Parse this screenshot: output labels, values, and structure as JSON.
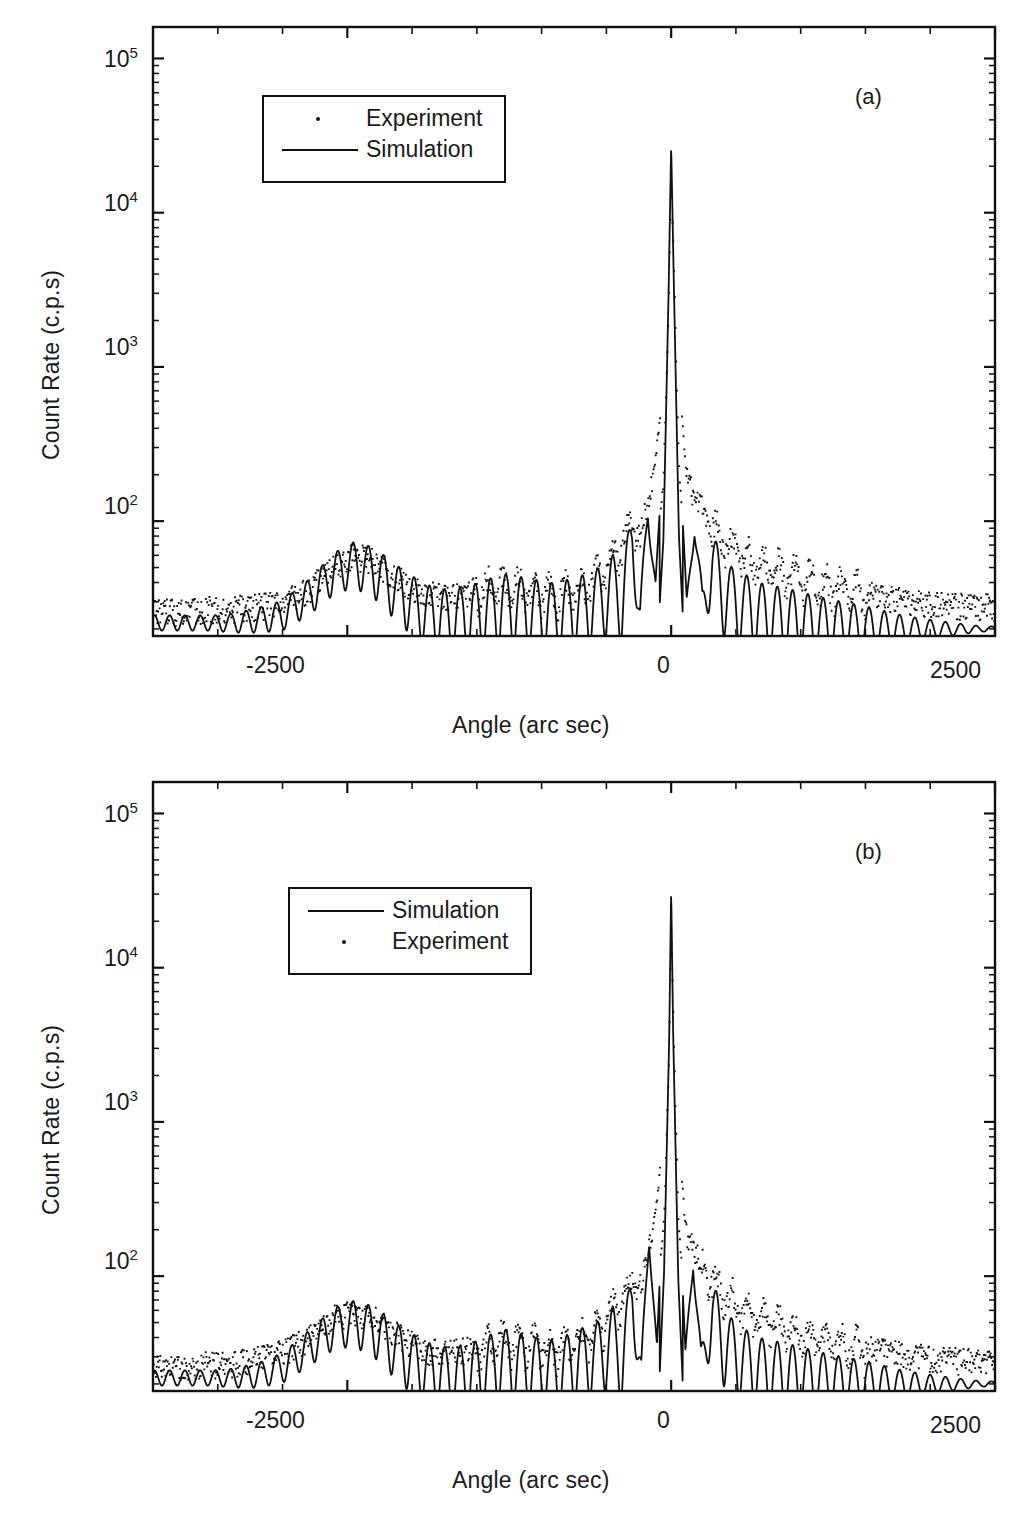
{
  "figure": {
    "type": "x-ray-rocking-curve-figure",
    "background_color": "#ffffff",
    "line_color": "#111111"
  },
  "panels": [
    {
      "tag": "(a)",
      "xlabel": "Angle (arc sec)",
      "ylabel": "Count Rate (c.p.s)",
      "xticks": [
        "-2500",
        "0",
        "2500"
      ],
      "yticks": [
        "10",
        "10",
        "10",
        "10"
      ],
      "yexp": [
        "5",
        "4",
        "3",
        "2"
      ],
      "legend": [
        {
          "label": "Experiment",
          "marker": "dot"
        },
        {
          "label": "Simulation",
          "marker": "line"
        }
      ]
    },
    {
      "tag": "(b)",
      "xlabel": "Angle (arc sec)",
      "ylabel": "Count Rate (c.p.s)",
      "xticks": [
        "-2500",
        "0",
        "2500"
      ],
      "yticks": [
        "10",
        "10",
        "10",
        "10"
      ],
      "yexp": [
        "5",
        "4",
        "3",
        "2"
      ],
      "legend": [
        {
          "label": "Simulation",
          "marker": "line"
        },
        {
          "label": "Experiment",
          "marker": "dot"
        }
      ]
    }
  ],
  "chart_data": [
    {
      "type": "line",
      "title": "(a)",
      "xlabel": "Angle (arc sec)",
      "ylabel": "Count Rate (c.p.s)",
      "xlim": [
        -4000,
        2500
      ],
      "ylim": [
        18,
        160000
      ],
      "yscale": "log",
      "xticks": [
        -2500,
        0,
        2500
      ],
      "yticks": [
        100,
        1000,
        10000,
        100000
      ],
      "ytick_labels": [
        "10^2",
        "10^3",
        "10^4",
        "10^5"
      ],
      "grid": false,
      "legend_position": "upper-left-inside",
      "series": [
        {
          "name": "Experiment",
          "style": "dotted-points",
          "description": "Measured rocking curve: noisy baseline ~25 c.p.s at far left, broad layer satellite peak centred near -2450 arc sec reaching ~60 c.p.s, weaker interference fringes between -2000 and -400, rising shoulder of Pendellosung fringes to ~300 c.p.s near -150, sharp substrate peak at 0 arc sec reaching ~7e4 c.p.s, decaying tail on the right from ~200 c.p.s down to ~28 c.p.s at +2500",
          "x": [
            -4000,
            -3800,
            -3600,
            -3400,
            -3200,
            -3000,
            -2800,
            -2600,
            -2450,
            -2300,
            -2100,
            -1900,
            -1700,
            -1500,
            -1300,
            -1100,
            -900,
            -700,
            -550,
            -450,
            -380,
            -300,
            -240,
            -180,
            -120,
            -60,
            -20,
            0,
            20,
            60,
            120,
            180,
            240,
            320,
            420,
            560,
            700,
            900,
            1200,
            1500,
            1800,
            2100,
            2400,
            2500
          ],
          "y": [
            26,
            26,
            27,
            27,
            28,
            30,
            36,
            50,
            60,
            56,
            42,
            34,
            33,
            36,
            38,
            36,
            34,
            37,
            45,
            58,
            70,
            95,
            80,
            130,
            260,
            700,
            9000,
            70000,
            20000,
            900,
            190,
            150,
            110,
            90,
            72,
            60,
            52,
            45,
            38,
            34,
            31,
            29,
            28,
            28
          ]
        },
        {
          "name": "Simulation",
          "style": "solid-line",
          "description": "Dynamical simulation: smooth baseline ~22 c.p.s, layer satellite peak near -2450 at ~55 c.p.s with fine fringes, strong regular Pendellosung fringe train between -1400 and -250 oscillating between ~22 and ~45 c.p.s, very sharp substrate peak at 0 reaching ~1.1e5 c.p.s, deep fringe minima either side, decaying fringe train on the right flattening to ~20 c.p.s",
          "x": [
            -4000,
            -3800,
            -3600,
            -3400,
            -3200,
            -3000,
            -2800,
            -2600,
            -2450,
            -2300,
            -2100,
            -1900,
            -1700,
            -1500,
            -1300,
            -1100,
            -900,
            -700,
            -550,
            -450,
            -380,
            -300,
            -240,
            -180,
            -120,
            -60,
            -20,
            0,
            20,
            60,
            120,
            180,
            240,
            320,
            420,
            560,
            700,
            900,
            1200,
            1500,
            1800,
            2100,
            2400,
            2500
          ],
          "y": [
            22,
            22,
            22,
            22,
            23,
            25,
            33,
            48,
            55,
            50,
            36,
            27,
            24,
            26,
            30,
            28,
            26,
            29,
            33,
            40,
            33,
            80,
            25,
            110,
            40,
            300,
            12000,
            110000,
            15000,
            320,
            30,
            95,
            28,
            55,
            35,
            30,
            26,
            24,
            22,
            21,
            20,
            20,
            20,
            20
          ]
        }
      ]
    },
    {
      "type": "line",
      "title": "(b)",
      "xlabel": "Angle (arc sec)",
      "ylabel": "Count Rate (c.p.s)",
      "xlim": [
        -4000,
        2500
      ],
      "ylim": [
        18,
        160000
      ],
      "yscale": "log",
      "xticks": [
        -2500,
        0,
        2500
      ],
      "yticks": [
        100,
        1000,
        10000,
        100000
      ],
      "ytick_labels": [
        "10^2",
        "10^3",
        "10^4",
        "10^5"
      ],
      "grid": false,
      "legend_position": "upper-left-inside",
      "series": [
        {
          "name": "Simulation",
          "style": "solid-line",
          "description": "Dynamical simulation: flat baseline ~22 c.p.s, broad layer peak near -2450 reaching ~52 c.p.s, dense fringe train from -1600 to -300 between ~22 and ~42 c.p.s, extremely sharp substrate peak at 0 reaching ~1.3e5 c.p.s, narrow fringe pair either side, slowly damping fringes out to +2500 settling near ~20 c.p.s",
          "x": [
            -4000,
            -3800,
            -3600,
            -3400,
            -3200,
            -3000,
            -2800,
            -2600,
            -2450,
            -2300,
            -2100,
            -1900,
            -1700,
            -1500,
            -1300,
            -1100,
            -900,
            -700,
            -550,
            -450,
            -380,
            -300,
            -230,
            -170,
            -110,
            -55,
            -15,
            0,
            15,
            55,
            110,
            170,
            230,
            320,
            420,
            560,
            700,
            900,
            1200,
            1500,
            1800,
            2100,
            2400,
            2500
          ],
          "y": [
            22,
            22,
            22,
            22,
            23,
            26,
            35,
            48,
            52,
            47,
            34,
            26,
            23,
            25,
            30,
            27,
            25,
            30,
            34,
            42,
            30,
            75,
            24,
            180,
            35,
            420,
            14000,
            130000,
            16000,
            380,
            32,
            130,
            27,
            60,
            38,
            30,
            26,
            24,
            22,
            21,
            20,
            20,
            20,
            20
          ]
        },
        {
          "name": "Experiment",
          "style": "dotted-points",
          "description": "Measured rocking curve: noisy baseline ~26 c.p.s, broad layer satellite peak centred near -2450 at ~58 c.p.s, weak fringes between -2000 and -500, shoulder rising to ~110 c.p.s near -200, sharp substrate peak at 0 reaching ~9e4 c.p.s, right-hand tail falling from ~250 c.p.s to ~28 c.p.s at +2500",
          "x": [
            -4000,
            -3800,
            -3600,
            -3400,
            -3200,
            -3000,
            -2800,
            -2600,
            -2450,
            -2300,
            -2100,
            -1900,
            -1700,
            -1500,
            -1300,
            -1100,
            -900,
            -700,
            -550,
            -450,
            -380,
            -300,
            -230,
            -170,
            -110,
            -55,
            -15,
            0,
            15,
            55,
            110,
            170,
            230,
            320,
            420,
            560,
            700,
            900,
            1200,
            1500,
            1800,
            2100,
            2400,
            2500
          ],
          "y": [
            26,
            26,
            27,
            27,
            29,
            32,
            40,
            54,
            58,
            54,
            41,
            33,
            32,
            34,
            38,
            36,
            34,
            38,
            46,
            60,
            72,
            95,
            82,
            150,
            300,
            900,
            11000,
            90000,
            22000,
            1000,
            200,
            160,
            120,
            92,
            74,
            60,
            52,
            45,
            38,
            34,
            31,
            29,
            28,
            28
          ]
        }
      ]
    }
  ]
}
